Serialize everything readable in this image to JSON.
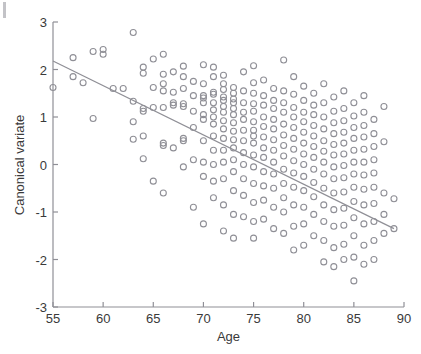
{
  "chart_data": {
    "type": "scatter",
    "title": "",
    "xlabel": "Age",
    "ylabel": "Canonical variate",
    "xlim": [
      55,
      90
    ],
    "ylim": [
      -3,
      3
    ],
    "xticks": [
      55,
      60,
      65,
      70,
      75,
      80,
      85,
      90
    ],
    "yticks": [
      3,
      2,
      1,
      0,
      -1,
      -2,
      -3
    ],
    "xtick_labels": [
      "55",
      "60",
      "65",
      "70",
      "75",
      "80",
      "85",
      "90"
    ],
    "ytick_labels": [
      "3",
      "2",
      "1",
      "0",
      "-1",
      "-2",
      "-3"
    ],
    "grid": false,
    "legend": null,
    "marker": {
      "shape": "circle-open",
      "size_px": 6,
      "stroke": "#8f8f96",
      "fill": "none"
    },
    "trend_line": {
      "type": "linear-fit",
      "color": "#8f8f96",
      "x": [
        55,
        89
      ],
      "y": [
        2.18,
        -1.35
      ],
      "slope": -0.1038,
      "intercept": 7.889
    },
    "axes": {
      "spine_color": "#8f8f96",
      "tick_color": "#8f8f96",
      "box": false
    },
    "points": [
      [
        55,
        1.62
      ],
      [
        57,
        2.25
      ],
      [
        57,
        1.85
      ],
      [
        58,
        1.72
      ],
      [
        59,
        2.38
      ],
      [
        59,
        0.97
      ],
      [
        60,
        2.42
      ],
      [
        60,
        2.32
      ],
      [
        61,
        1.6
      ],
      [
        62,
        1.6
      ],
      [
        63,
        2.78
      ],
      [
        63,
        1.33
      ],
      [
        63,
        0.9
      ],
      [
        63,
        0.53
      ],
      [
        64,
        2.05
      ],
      [
        64,
        1.92
      ],
      [
        64,
        1.18
      ],
      [
        64,
        1.12
      ],
      [
        64,
        0.6
      ],
      [
        64,
        0.12
      ],
      [
        65,
        2.22
      ],
      [
        65,
        1.62
      ],
      [
        65,
        1.2
      ],
      [
        65,
        -0.35
      ],
      [
        66,
        2.32
      ],
      [
        66,
        1.9
      ],
      [
        66,
        1.7
      ],
      [
        66,
        1.55
      ],
      [
        66,
        1.2
      ],
      [
        66,
        0.45
      ],
      [
        66,
        0.4
      ],
      [
        66,
        -0.6
      ],
      [
        67,
        1.95
      ],
      [
        67,
        1.52
      ],
      [
        67,
        1.3
      ],
      [
        67,
        1.25
      ],
      [
        67,
        0.35
      ],
      [
        68,
        2.07
      ],
      [
        68,
        1.85
      ],
      [
        68,
        1.6
      ],
      [
        68,
        1.28
      ],
      [
        68,
        1.22
      ],
      [
        68,
        0.55
      ],
      [
        68,
        0.5
      ],
      [
        68,
        -0.05
      ],
      [
        69,
        1.75
      ],
      [
        69,
        1.45
      ],
      [
        69,
        1.12
      ],
      [
        69,
        0.78
      ],
      [
        69,
        0.1
      ],
      [
        69,
        -0.9
      ],
      [
        70,
        2.1
      ],
      [
        70,
        1.7
      ],
      [
        70,
        1.45
      ],
      [
        70,
        1.4
      ],
      [
        70,
        1.3
      ],
      [
        70,
        1.05
      ],
      [
        70,
        0.95
      ],
      [
        70,
        0.5
      ],
      [
        70,
        0.05
      ],
      [
        70,
        -0.25
      ],
      [
        70,
        -1.25
      ],
      [
        71,
        2.05
      ],
      [
        71,
        1.85
      ],
      [
        71,
        1.52
      ],
      [
        71,
        1.48
      ],
      [
        71,
        1.3
      ],
      [
        71,
        1.15
      ],
      [
        71,
        1.0
      ],
      [
        71,
        0.85
      ],
      [
        71,
        0.6
      ],
      [
        71,
        0.3
      ],
      [
        71,
        0.0
      ],
      [
        71,
        -0.35
      ],
      [
        71,
        -0.7
      ],
      [
        72,
        1.88
      ],
      [
        72,
        1.7
      ],
      [
        72,
        1.58
      ],
      [
        72,
        1.42
      ],
      [
        72,
        1.35
      ],
      [
        72,
        1.22
      ],
      [
        72,
        1.1
      ],
      [
        72,
        0.92
      ],
      [
        72,
        0.75
      ],
      [
        72,
        0.55
      ],
      [
        72,
        0.3
      ],
      [
        72,
        0.05
      ],
      [
        72,
        -0.3
      ],
      [
        72,
        -0.85
      ],
      [
        72,
        -1.4
      ],
      [
        73,
        1.62
      ],
      [
        73,
        1.5
      ],
      [
        73,
        1.38
      ],
      [
        73,
        1.3
      ],
      [
        73,
        1.18
      ],
      [
        73,
        1.05
      ],
      [
        73,
        0.88
      ],
      [
        73,
        0.7
      ],
      [
        73,
        0.52
      ],
      [
        73,
        0.35
      ],
      [
        73,
        0.1
      ],
      [
        73,
        -0.15
      ],
      [
        73,
        -0.55
      ],
      [
        73,
        -1.05
      ],
      [
        73,
        -1.55
      ],
      [
        74,
        1.95
      ],
      [
        74,
        1.55
      ],
      [
        74,
        1.3
      ],
      [
        74,
        1.1
      ],
      [
        74,
        0.95
      ],
      [
        74,
        0.72
      ],
      [
        74,
        0.5
      ],
      [
        74,
        0.25
      ],
      [
        74,
        0.0
      ],
      [
        74,
        -0.3
      ],
      [
        74,
        -0.65
      ],
      [
        74,
        -1.1
      ],
      [
        75,
        2.08
      ],
      [
        75,
        1.72
      ],
      [
        75,
        1.5
      ],
      [
        75,
        1.28
      ],
      [
        75,
        1.12
      ],
      [
        75,
        0.9
      ],
      [
        75,
        0.72
      ],
      [
        75,
        0.6
      ],
      [
        75,
        0.45
      ],
      [
        75,
        0.2
      ],
      [
        75,
        -0.05
      ],
      [
        75,
        -0.4
      ],
      [
        75,
        -0.8
      ],
      [
        75,
        -1.2
      ],
      [
        75,
        -1.55
      ],
      [
        76,
        1.78
      ],
      [
        76,
        1.45
      ],
      [
        76,
        1.25
      ],
      [
        76,
        1.0
      ],
      [
        76,
        0.8
      ],
      [
        76,
        0.58
      ],
      [
        76,
        0.35
      ],
      [
        76,
        0.15
      ],
      [
        76,
        -0.15
      ],
      [
        76,
        -0.45
      ],
      [
        76,
        -0.75
      ],
      [
        76,
        -1.15
      ],
      [
        77,
        1.6
      ],
      [
        77,
        1.35
      ],
      [
        77,
        1.18
      ],
      [
        77,
        0.95
      ],
      [
        77,
        0.75
      ],
      [
        77,
        0.52
      ],
      [
        77,
        0.3
      ],
      [
        77,
        0.05
      ],
      [
        77,
        -0.2
      ],
      [
        77,
        -0.5
      ],
      [
        77,
        -0.9
      ],
      [
        77,
        -1.35
      ],
      [
        78,
        2.2
      ],
      [
        78,
        1.55
      ],
      [
        78,
        1.3
      ],
      [
        78,
        1.1
      ],
      [
        78,
        0.85
      ],
      [
        78,
        0.62
      ],
      [
        78,
        0.4
      ],
      [
        78,
        0.18
      ],
      [
        78,
        -0.1
      ],
      [
        78,
        -0.4
      ],
      [
        78,
        -0.7
      ],
      [
        78,
        -1.0
      ],
      [
        78,
        -1.45
      ],
      [
        79,
        1.85
      ],
      [
        79,
        1.48
      ],
      [
        79,
        1.2
      ],
      [
        79,
        1.0
      ],
      [
        79,
        0.78
      ],
      [
        79,
        0.55
      ],
      [
        79,
        0.32
      ],
      [
        79,
        0.08
      ],
      [
        79,
        -0.18
      ],
      [
        79,
        -0.48
      ],
      [
        79,
        -0.85
      ],
      [
        79,
        -1.3
      ],
      [
        79,
        -1.8
      ],
      [
        80,
        1.65
      ],
      [
        80,
        1.35
      ],
      [
        80,
        1.1
      ],
      [
        80,
        0.9
      ],
      [
        80,
        0.68
      ],
      [
        80,
        0.45
      ],
      [
        80,
        0.22
      ],
      [
        80,
        0.0
      ],
      [
        80,
        -0.25
      ],
      [
        80,
        -0.55
      ],
      [
        80,
        -0.9
      ],
      [
        80,
        -1.25
      ],
      [
        80,
        -1.7
      ],
      [
        81,
        1.5
      ],
      [
        81,
        1.25
      ],
      [
        81,
        1.05
      ],
      [
        81,
        0.82
      ],
      [
        81,
        0.6
      ],
      [
        81,
        0.38
      ],
      [
        81,
        0.15
      ],
      [
        81,
        -0.1
      ],
      [
        81,
        -0.38
      ],
      [
        81,
        -0.68
      ],
      [
        81,
        -1.05
      ],
      [
        81,
        -1.5
      ],
      [
        82,
        1.7
      ],
      [
        82,
        1.3
      ],
      [
        82,
        1.0
      ],
      [
        82,
        0.75
      ],
      [
        82,
        0.5
      ],
      [
        82,
        0.28
      ],
      [
        82,
        0.05
      ],
      [
        82,
        -0.2
      ],
      [
        82,
        -0.5
      ],
      [
        82,
        -0.85
      ],
      [
        82,
        -1.2
      ],
      [
        82,
        -1.6
      ],
      [
        82,
        -2.05
      ],
      [
        83,
        1.42
      ],
      [
        83,
        1.12
      ],
      [
        83,
        0.88
      ],
      [
        83,
        0.65
      ],
      [
        83,
        0.42
      ],
      [
        83,
        0.2
      ],
      [
        83,
        -0.05
      ],
      [
        83,
        -0.3
      ],
      [
        83,
        -0.6
      ],
      [
        83,
        -0.95
      ],
      [
        83,
        -1.3
      ],
      [
        83,
        -1.75
      ],
      [
        83,
        -2.15
      ],
      [
        84,
        1.55
      ],
      [
        84,
        1.18
      ],
      [
        84,
        0.92
      ],
      [
        84,
        0.68
      ],
      [
        84,
        0.45
      ],
      [
        84,
        0.22
      ],
      [
        84,
        -0.02
      ],
      [
        84,
        -0.28
      ],
      [
        84,
        -0.58
      ],
      [
        84,
        -0.92
      ],
      [
        84,
        -1.28
      ],
      [
        84,
        -1.68
      ],
      [
        84,
        -2.0
      ],
      [
        85,
        1.3
      ],
      [
        85,
        1.02
      ],
      [
        85,
        0.78
      ],
      [
        85,
        0.55
      ],
      [
        85,
        0.3
      ],
      [
        85,
        0.05
      ],
      [
        85,
        -0.2
      ],
      [
        85,
        -0.48
      ],
      [
        85,
        -0.78
      ],
      [
        85,
        -1.12
      ],
      [
        85,
        -1.5
      ],
      [
        85,
        -1.95
      ],
      [
        85,
        -2.45
      ],
      [
        86,
        1.45
      ],
      [
        86,
        1.1
      ],
      [
        86,
        0.82
      ],
      [
        86,
        0.58
      ],
      [
        86,
        0.32
      ],
      [
        86,
        0.05
      ],
      [
        86,
        -0.22
      ],
      [
        86,
        -0.52
      ],
      [
        86,
        -0.85
      ],
      [
        86,
        -1.25
      ],
      [
        86,
        -1.7
      ],
      [
        86,
        -2.1
      ],
      [
        87,
        0.95
      ],
      [
        87,
        0.65
      ],
      [
        87,
        0.38
      ],
      [
        87,
        0.1
      ],
      [
        87,
        -0.18
      ],
      [
        87,
        -0.48
      ],
      [
        87,
        -0.82
      ],
      [
        87,
        -1.2
      ],
      [
        87,
        -1.6
      ],
      [
        87,
        -2.0
      ],
      [
        88,
        1.22
      ],
      [
        88,
        0.48
      ],
      [
        88,
        -0.6
      ],
      [
        88,
        -1.05
      ],
      [
        88,
        -1.45
      ],
      [
        89,
        -0.72
      ],
      [
        89,
        -1.35
      ]
    ]
  }
}
